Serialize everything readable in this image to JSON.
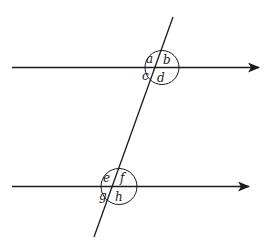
{
  "diagram": {
    "upper_intersection": {
      "labels": [
        "a",
        "b",
        "c",
        "d"
      ]
    },
    "lower_intersection": {
      "labels": [
        "e",
        "f",
        "g",
        "h"
      ]
    },
    "colors": {
      "stroke": "#1a1a1a",
      "background": "#ffffff"
    }
  }
}
